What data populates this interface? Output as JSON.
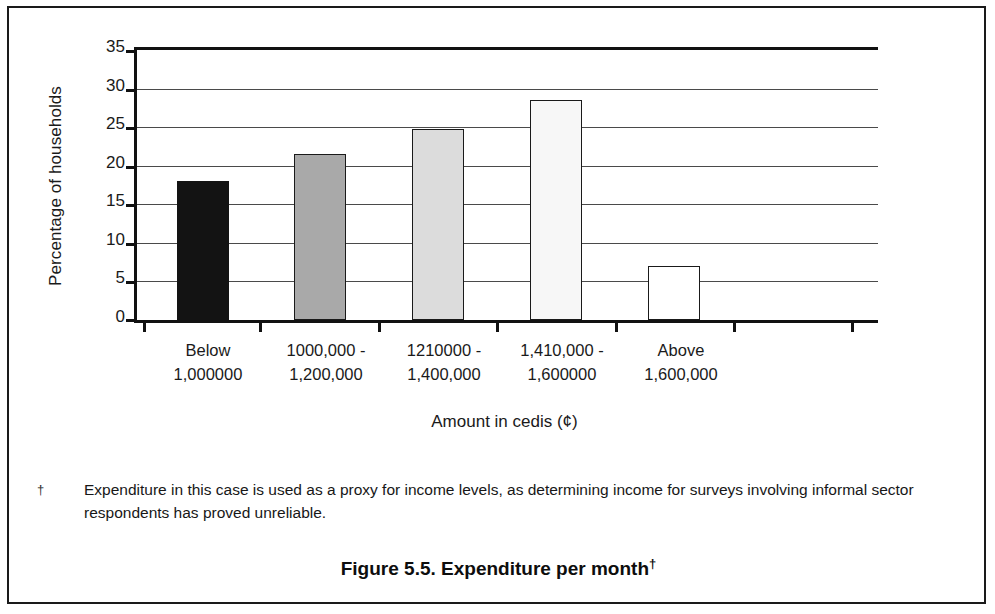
{
  "figure": {
    "caption_text": "Figure 5.5. Expenditure per month",
    "caption_dagger": "†",
    "footnote_marker": "†",
    "footnote_text": "Expenditure in this case is used as a proxy for income levels, as determining income for surveys involving informal sector respondents has proved unreliable."
  },
  "chart_data": {
    "type": "bar",
    "title": "Figure 5.5. Expenditure per month",
    "xlabel": "Amount in cedis (¢)",
    "ylabel": "Percentage of households",
    "ylim": [
      0,
      35
    ],
    "ytick_labels": [
      "35",
      "30",
      "25",
      "20",
      "15",
      "10",
      "5",
      "0"
    ],
    "ytick_values": [
      35,
      30,
      25,
      20,
      15,
      10,
      5,
      0
    ],
    "grid": true,
    "legend": "none",
    "categories": [
      {
        "line1": "Below",
        "line2": "1,000000"
      },
      {
        "line1": "1000,000 -",
        "line2": "1,200,000"
      },
      {
        "line1": "1210000 -",
        "line2": "1,400,000"
      },
      {
        "line1": "1,410,000 -",
        "line2": "1,600000"
      },
      {
        "line1": "Above",
        "line2": "1,600,000"
      }
    ],
    "values": [
      18.0,
      21.5,
      24.7,
      28.5,
      7.0
    ],
    "bar_fills": [
      "#131313",
      "#a9a9a9",
      "#dcdcdc",
      "#f7f7f7",
      "#ffffff"
    ],
    "bar_fill_classes": [
      "fill-black",
      "fill-midgray",
      "fill-lightgray",
      "fill-verylight",
      "fill-white"
    ]
  }
}
